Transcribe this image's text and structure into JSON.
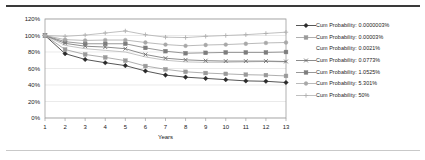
{
  "chart_data": {
    "type": "line",
    "title": "",
    "xlabel": "Years",
    "ylabel": "",
    "x": [
      1,
      2,
      3,
      4,
      5,
      6,
      7,
      8,
      9,
      10,
      11,
      12,
      13
    ],
    "xticklabels": [
      "1",
      "2",
      "3",
      "4",
      "5",
      "6",
      "7",
      "8",
      "9",
      "10",
      "11",
      "12",
      "13"
    ],
    "yticklabels": [
      "0%",
      "20%",
      "40%",
      "60%",
      "80%",
      "100%",
      "120%"
    ],
    "ytickvalues": [
      0,
      20,
      40,
      60,
      80,
      100,
      120
    ],
    "ylim": [
      0,
      120
    ],
    "xlim": [
      1,
      13
    ],
    "grid": true,
    "legend_position": "right",
    "series": [
      {
        "name": "Cum Probability: 0.0000003%",
        "marker": "diamond",
        "color": "#2b2b2b",
        "values": [
          100,
          78,
          71,
          67,
          63.5,
          57,
          52,
          49.5,
          48,
          46.5,
          45,
          44.5,
          43
        ]
      },
      {
        "name": "Cum Probability: 0.00003%",
        "marker": "square",
        "color": "#9a9a9a",
        "values": [
          100,
          83,
          77,
          73.5,
          69.5,
          63,
          59,
          56,
          54.5,
          53.5,
          52.5,
          52,
          51
        ]
      },
      {
        "name": "Cum Probability: 0.0021%",
        "marker": "none",
        "color": "#b5b5b5",
        "values": [
          100,
          88,
          84,
          82,
          80,
          74,
          70,
          68,
          67.5,
          67.5,
          68,
          68.5,
          68
        ]
      },
      {
        "name": "Cum Probability: 0.0773%",
        "marker": "x",
        "color": "#6e6e6e",
        "values": [
          100,
          90.5,
          87,
          86,
          84,
          77,
          72.5,
          70.5,
          69.5,
          69,
          69,
          69,
          68.5
        ]
      },
      {
        "name": "Cum Probability: 1.0525%",
        "marker": "square",
        "color": "#7d7d7d",
        "values": [
          100,
          92.5,
          90,
          90,
          90,
          85,
          81,
          78.5,
          79,
          79.5,
          79.5,
          79.5,
          80
        ]
      },
      {
        "name": "Cum Probability: 5.301%",
        "marker": "circle",
        "color": "#a8a8a8",
        "values": [
          100,
          95,
          94,
          94.5,
          94.5,
          91.5,
          89,
          87.5,
          88.5,
          89,
          90,
          91,
          91.5
        ]
      },
      {
        "name": "Cum Probability: 50%",
        "marker": "plus",
        "color": "#b0b0b0",
        "values": [
          100,
          99,
          100.5,
          103,
          105.5,
          101,
          98,
          97.5,
          99,
          100,
          101,
          102.5,
          104
        ]
      }
    ]
  },
  "axis": {
    "x_title": "Years"
  },
  "legend": {
    "items": [
      {
        "label": "Cum Probability: 0.0000003%"
      },
      {
        "label": "Cum Probability: 0.00003%"
      },
      {
        "label": "Cum Probability: 0.0021%"
      },
      {
        "label": "Cum Probability: 0.0773%"
      },
      {
        "label": "Cum Probability: 1.0525%"
      },
      {
        "label": "Cum Probability: 5.301%"
      },
      {
        "label": "Cum Probability: 50%"
      }
    ]
  }
}
